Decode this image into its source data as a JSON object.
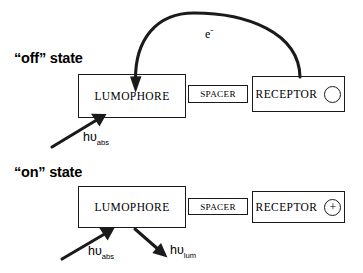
{
  "diagram": {
    "states": [
      {
        "key": "off",
        "label": "“off” state"
      },
      {
        "key": "on",
        "label": "“on” state"
      }
    ],
    "components": {
      "lumophore": "LUMOPHORE",
      "spacer": "SPACER",
      "receptor": "RECEPTOR"
    },
    "receptor_marker": {
      "off": "",
      "on": "+"
    },
    "labels": {
      "electron": "e",
      "electron_charge": "-",
      "photon_symbol": "hυ",
      "absorption_subscript": "abs",
      "luminescence_subscript": "lum"
    },
    "arrows": [
      {
        "name": "electron-transfer-arrow",
        "state": "off",
        "from": "receptor",
        "to": "lumophore",
        "style": "curved"
      },
      {
        "name": "absorption-arrow-off",
        "state": "off",
        "to": "lumophore",
        "style": "straight"
      },
      {
        "name": "absorption-arrow-on",
        "state": "on",
        "to": "lumophore",
        "style": "straight"
      },
      {
        "name": "luminescence-arrow-on",
        "state": "on",
        "from": "lumophore",
        "style": "straight"
      }
    ],
    "colors": {
      "stroke": "#1a1a1a",
      "background": "#ffffff",
      "text": "#000000"
    }
  }
}
